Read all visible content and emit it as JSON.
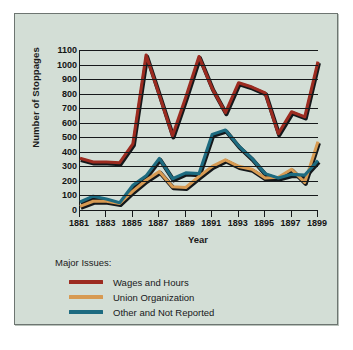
{
  "figure": {
    "panel_bg": "#d3ded6",
    "border_color": "#6d7571"
  },
  "legend": {
    "title": "Major Issues:",
    "position": "below-plot-left",
    "entries": [
      {
        "label": "Wages and Hours",
        "color": "#9c2b20"
      },
      {
        "label": "Union Organization",
        "color": "#d79a52"
      },
      {
        "label": "Other and Not Reported",
        "color": "#1d6b80"
      }
    ]
  },
  "chart_data": {
    "type": "line",
    "title": "",
    "xlabel": "Year",
    "ylabel": "Number of Stoppages",
    "xlim": [
      1881,
      1899
    ],
    "ylim": [
      0,
      1100
    ],
    "yticks": [
      0,
      100,
      200,
      300,
      400,
      500,
      600,
      700,
      800,
      900,
      1000,
      1100
    ],
    "ytick_labels": [
      "0",
      "100",
      "200",
      "300",
      "400",
      "500",
      "600",
      "700",
      "800",
      "900",
      "1000",
      "1100"
    ],
    "xticks": [
      1881,
      1883,
      1885,
      1887,
      1889,
      1891,
      1893,
      1895,
      1897,
      1899
    ],
    "xtick_labels": [
      "1881",
      "1883",
      "1885",
      "1887",
      "1889",
      "1891",
      "1893",
      "1895",
      "1897",
      "1899"
    ],
    "x": [
      1881,
      1882,
      1883,
      1884,
      1885,
      1886,
      1887,
      1888,
      1889,
      1890,
      1891,
      1892,
      1893,
      1894,
      1895,
      1896,
      1897,
      1898,
      1899
    ],
    "grid": "horizontal",
    "series": [
      {
        "name": "Wages and Hours",
        "color": "#9c2b20",
        "values": [
          355,
          330,
          330,
          325,
          455,
          1065,
          790,
          510,
          775,
          1055,
          835,
          670,
          875,
          845,
          805,
          525,
          675,
          640,
          1020
        ]
      },
      {
        "name": "Union Organization",
        "color": "#d79a52",
        "values": [
          25,
          60,
          60,
          45,
          130,
          205,
          265,
          160,
          155,
          230,
          300,
          345,
          300,
          280,
          220,
          225,
          280,
          190,
          470
        ]
      },
      {
        "name": "Other and Not Reported",
        "color": "#1d6b80",
        "values": [
          55,
          95,
          75,
          50,
          170,
          235,
          355,
          215,
          255,
          250,
          520,
          550,
          440,
          355,
          250,
          220,
          245,
          240,
          340
        ]
      }
    ]
  }
}
